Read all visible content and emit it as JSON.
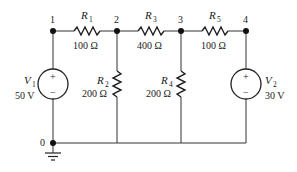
{
  "diagram": {
    "type": "circuit-schematic",
    "nodes": [
      {
        "id": "1",
        "label": "1"
      },
      {
        "id": "2",
        "label": "2"
      },
      {
        "id": "3",
        "label": "3"
      },
      {
        "id": "4",
        "label": "4"
      },
      {
        "id": "0",
        "label": "0"
      }
    ],
    "resistors": [
      {
        "name": "R",
        "sub": "1",
        "value": "100 Ω",
        "between": [
          "1",
          "2"
        ]
      },
      {
        "name": "R",
        "sub": "2",
        "value": "200 Ω",
        "between": [
          "2",
          "0"
        ]
      },
      {
        "name": "R",
        "sub": "3",
        "value": "400 Ω",
        "between": [
          "2",
          "3"
        ]
      },
      {
        "name": "R",
        "sub": "4",
        "value": "200 Ω",
        "between": [
          "3",
          "0"
        ]
      },
      {
        "name": "R",
        "sub": "5",
        "value": "100 Ω",
        "between": [
          "3",
          "4"
        ]
      }
    ],
    "sources": [
      {
        "name": "V",
        "sub": "1",
        "value": "50 V",
        "plus": "+",
        "minus": "−",
        "between": [
          "1",
          "0"
        ]
      },
      {
        "name": "V",
        "sub": "2",
        "value": "30 V",
        "plus": "+",
        "minus": "−",
        "between": [
          "4",
          "0"
        ]
      }
    ],
    "ground": {
      "node": "0"
    }
  }
}
